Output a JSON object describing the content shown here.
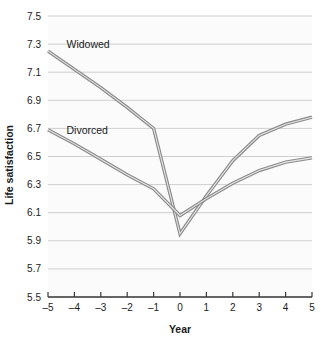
{
  "chart_data": {
    "type": "line",
    "title": "",
    "xlabel": "Year",
    "ylabel": "Life satisfaction",
    "x": [
      -5,
      -4,
      -3,
      -2,
      -1,
      0,
      1,
      2,
      3,
      4,
      5
    ],
    "xtick_labels": [
      "–5",
      "–4",
      "–3",
      "–2",
      "–1",
      "0",
      "1",
      "2",
      "3",
      "4",
      "5"
    ],
    "xlim": [
      -5,
      5
    ],
    "ylim": [
      5.5,
      7.5
    ],
    "yticks": [
      5.5,
      5.7,
      5.9,
      6.1,
      6.3,
      6.5,
      6.7,
      6.9,
      7.1,
      7.3,
      7.5
    ],
    "ytick_labels": [
      "5.5",
      "5.7",
      "5.9",
      "6.1",
      "6.3",
      "6.5",
      "6.7",
      "6.9",
      "7.1",
      "7.3",
      "7.5"
    ],
    "grid": "horizontal",
    "legend": "inline-annotations",
    "line_color": "#8c8c8c",
    "grid_color": "#cfcfcf",
    "axis_color": "#3a3a3a",
    "background": "#fbfbfb",
    "series": [
      {
        "name": "Widowed",
        "label_x": -4.3,
        "label_y": 7.27,
        "values": [
          7.25,
          7.12,
          6.99,
          6.85,
          6.7,
          5.95,
          6.22,
          6.47,
          6.65,
          6.73,
          6.78
        ]
      },
      {
        "name": "Divorced",
        "label_x": -4.3,
        "label_y": 6.66,
        "values": [
          6.69,
          6.59,
          6.48,
          6.37,
          6.27,
          6.08,
          6.2,
          6.31,
          6.4,
          6.46,
          6.49
        ]
      }
    ]
  }
}
